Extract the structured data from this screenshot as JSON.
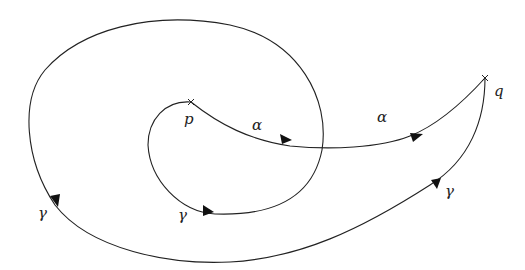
{
  "diagram": {
    "points": [
      {
        "id": "p",
        "label": "p",
        "x": 191,
        "y": 102
      },
      {
        "id": "q",
        "label": "q",
        "x": 485,
        "y": 78
      }
    ],
    "paths": [
      {
        "id": "alpha",
        "label": "α",
        "from": "p",
        "to": "q",
        "arrows": 2
      },
      {
        "id": "gamma",
        "label": "γ",
        "from": "p",
        "to": "q",
        "arrows": 3,
        "winds_around": "p"
      }
    ],
    "labels": {
      "p": "p",
      "q": "q",
      "alpha_1": "α",
      "alpha_2": "α",
      "gamma_1": "γ",
      "gamma_2": "γ",
      "gamma_3": "γ"
    },
    "stroke_color": "#222222"
  }
}
